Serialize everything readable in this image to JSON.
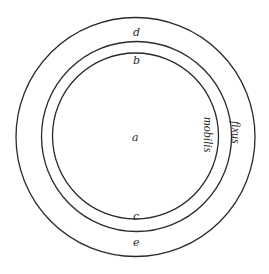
{
  "diagram": {
    "circles": [
      {
        "name": "outer-circle",
        "cx": 135.5,
        "cy": 137,
        "r": 119.5
      },
      {
        "name": "middle-circle",
        "cx": 136.5,
        "cy": 136.5,
        "r": 95
      },
      {
        "name": "inner-circle",
        "cx": 135.5,
        "cy": 136,
        "r": 83
      }
    ],
    "labels": {
      "a": "a",
      "b": "b",
      "c": "c",
      "d": "d",
      "e": "e",
      "mobilis": "mobilis",
      "fixus": "fixus"
    }
  }
}
